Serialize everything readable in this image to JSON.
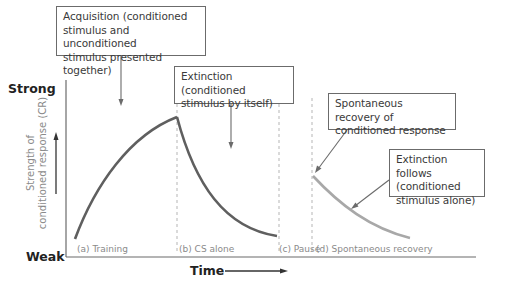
{
  "diagram": {
    "y_axis": {
      "top_label": "Strong",
      "bottom_label": "Weak",
      "title_line1": "Strength of",
      "title_line2": "conditioned response (CR)"
    },
    "x_axis": {
      "title": "Time"
    },
    "phases": [
      {
        "id": "a",
        "label": "(a) Training"
      },
      {
        "id": "b",
        "label": "(b) CS alone"
      },
      {
        "id": "c",
        "label": "(c) Pause"
      },
      {
        "id": "d",
        "label": "(d) Spontaneous recovery"
      }
    ],
    "callouts": {
      "acquisition": {
        "line1": "Acquisition (conditioned",
        "line2": "stimulus and unconditioned",
        "line3": "stimulus presented together)"
      },
      "extinction": {
        "line1": "Extinction (conditioned",
        "line2": "stimulus by itself)"
      },
      "spontaneous": {
        "line1": "Spontaneous recovery of",
        "line2": "conditioned response"
      },
      "extinction_follows": {
        "line1": "Extinction follows",
        "line2": "(conditioned",
        "line3": "stimulus alone)"
      }
    },
    "colors": {
      "main_curve": "#5f5f5f",
      "recovery_curve": "#a8a8a8",
      "axis": "#6b6b6b",
      "dashed": "#b5b5b5"
    }
  }
}
